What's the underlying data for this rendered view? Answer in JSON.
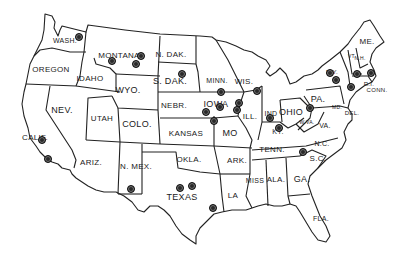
{
  "map": {
    "title": "United States map with numbered location markers",
    "line_color": "#222222",
    "background": "#ffffff",
    "states": [
      {
        "label": "WASH.",
        "x": 65,
        "y": 40,
        "size": 7
      },
      {
        "label": "OREGON",
        "x": 51,
        "y": 70,
        "size": 8
      },
      {
        "label": "IDAHO",
        "x": 90,
        "y": 79,
        "size": 8
      },
      {
        "label": "MONTANA",
        "x": 119,
        "y": 56,
        "size": 8
      },
      {
        "label": "WYO.",
        "x": 128,
        "y": 90,
        "size": 9
      },
      {
        "label": "NEV.",
        "x": 62,
        "y": 110,
        "size": 9
      },
      {
        "label": "CALIF.",
        "x": 35,
        "y": 138,
        "size": 8
      },
      {
        "label": "UTAH",
        "x": 102,
        "y": 119,
        "size": 8
      },
      {
        "label": "COLO.",
        "x": 137,
        "y": 124,
        "size": 9
      },
      {
        "label": "ARIZ.",
        "x": 91,
        "y": 163,
        "size": 8
      },
      {
        "label": "N. MEX.",
        "x": 136,
        "y": 167,
        "size": 8
      },
      {
        "label": "N. DAK.",
        "x": 171,
        "y": 55,
        "size": 8
      },
      {
        "label": "S. DAK.",
        "x": 170,
        "y": 81,
        "size": 9
      },
      {
        "label": "NEBR.",
        "x": 174,
        "y": 106,
        "size": 8
      },
      {
        "label": "KANSAS",
        "x": 186,
        "y": 134,
        "size": 8
      },
      {
        "label": "OKLA.",
        "x": 189,
        "y": 160,
        "size": 8
      },
      {
        "label": "TEXAS",
        "x": 182,
        "y": 197,
        "size": 9
      },
      {
        "label": "MINN.",
        "x": 217,
        "y": 80,
        "size": 7
      },
      {
        "label": "IOWA",
        "x": 216,
        "y": 104,
        "size": 9
      },
      {
        "label": "MO",
        "x": 230,
        "y": 133,
        "size": 9
      },
      {
        "label": "ARK.",
        "x": 237,
        "y": 161,
        "size": 8
      },
      {
        "label": "LA",
        "x": 233,
        "y": 196,
        "size": 8
      },
      {
        "label": "WIS.",
        "x": 244,
        "y": 82,
        "size": 8
      },
      {
        "label": "ILL.",
        "x": 250,
        "y": 117,
        "size": 8
      },
      {
        "label": "MISS",
        "x": 255,
        "y": 180,
        "size": 7
      },
      {
        "label": "IND",
        "x": 271,
        "y": 113,
        "size": 7
      },
      {
        "label": "OHIO",
        "x": 291,
        "y": 112,
        "size": 9
      },
      {
        "label": "KY.",
        "x": 278,
        "y": 131,
        "size": 7
      },
      {
        "label": "TENN.",
        "x": 272,
        "y": 150,
        "size": 8
      },
      {
        "label": "ALA.",
        "x": 276,
        "y": 180,
        "size": 8
      },
      {
        "label": "GA.",
        "x": 302,
        "y": 179,
        "size": 9
      },
      {
        "label": "FLA.",
        "x": 321,
        "y": 218,
        "size": 7
      },
      {
        "label": "S.C.",
        "x": 318,
        "y": 159,
        "size": 8
      },
      {
        "label": "N.C.",
        "x": 322,
        "y": 143,
        "size": 7
      },
      {
        "label": "VA.",
        "x": 325,
        "y": 125,
        "size": 7
      },
      {
        "label": "W.VA.",
        "x": 307,
        "y": 122,
        "size": 5
      },
      {
        "label": "PA.",
        "x": 318,
        "y": 99,
        "size": 9
      },
      {
        "label": "MD.",
        "x": 337,
        "y": 107,
        "size": 5
      },
      {
        "label": "DEL.",
        "x": 352,
        "y": 113,
        "size": 6
      },
      {
        "label": "N.Y.",
        "x": 332,
        "y": 72,
        "size": 6
      },
      {
        "label": "VT.",
        "x": 352,
        "y": 56,
        "size": 5
      },
      {
        "label": "N.H.",
        "x": 360,
        "y": 58,
        "size": 5
      },
      {
        "label": "ME.",
        "x": 367,
        "y": 42,
        "size": 8
      },
      {
        "label": "R.I.",
        "x": 369,
        "y": 84,
        "size": 6
      },
      {
        "label": "CONN.",
        "x": 377,
        "y": 90,
        "size": 6
      }
    ],
    "markers": [
      {
        "label": "1",
        "x": 79,
        "y": 37
      },
      {
        "label": "2",
        "x": 112,
        "y": 61
      },
      {
        "label": "3",
        "x": 141,
        "y": 56
      },
      {
        "label": "4",
        "x": 136,
        "y": 64
      },
      {
        "label": "5",
        "x": 182,
        "y": 74
      },
      {
        "label": "6",
        "x": 42,
        "y": 140
      },
      {
        "label": "7",
        "x": 48,
        "y": 159
      },
      {
        "label": "8",
        "x": 221,
        "y": 92
      },
      {
        "label": "9",
        "x": 220,
        "y": 107
      },
      {
        "label": "10",
        "x": 239,
        "y": 103
      },
      {
        "label": "11",
        "x": 237,
        "y": 110
      },
      {
        "label": "12",
        "x": 206,
        "y": 112
      },
      {
        "label": "13",
        "x": 214,
        "y": 121
      },
      {
        "label": "14",
        "x": 257,
        "y": 91
      },
      {
        "label": "15",
        "x": 270,
        "y": 118
      },
      {
        "label": "16",
        "x": 279,
        "y": 128
      },
      {
        "label": "17",
        "x": 310,
        "y": 108
      },
      {
        "label": "18",
        "x": 303,
        "y": 152
      },
      {
        "label": "19",
        "x": 131,
        "y": 189
      },
      {
        "label": "20",
        "x": 180,
        "y": 188
      },
      {
        "label": "21",
        "x": 192,
        "y": 186
      },
      {
        "label": "22",
        "x": 213,
        "y": 208
      },
      {
        "label": "23",
        "x": 330,
        "y": 73
      },
      {
        "label": "24",
        "x": 336,
        "y": 80
      },
      {
        "label": "25",
        "x": 351,
        "y": 87
      },
      {
        "label": "26",
        "x": 357,
        "y": 74
      },
      {
        "label": "27",
        "x": 371,
        "y": 73
      }
    ]
  }
}
